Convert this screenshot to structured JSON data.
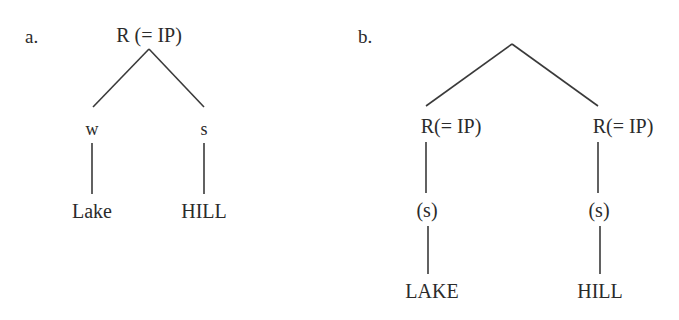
{
  "figure": {
    "background_color": "#ffffff",
    "ink_color": "#2b2b2b",
    "line_color": "#3a3a3a",
    "panels": [
      {
        "id": "a",
        "label": "a.",
        "nodes": {
          "root": "R (= IP)",
          "left_branch": "w",
          "right_branch": "s",
          "left_leaf": "Lake",
          "right_leaf": "HILL"
        }
      },
      {
        "id": "b",
        "label": "b.",
        "nodes": {
          "root": "",
          "left_branch": "R(= IP)",
          "right_branch": "R(= IP)",
          "left_mid": "(s)",
          "right_mid": "(s)",
          "left_leaf": "LAKE",
          "right_leaf": "HILL"
        }
      }
    ]
  }
}
